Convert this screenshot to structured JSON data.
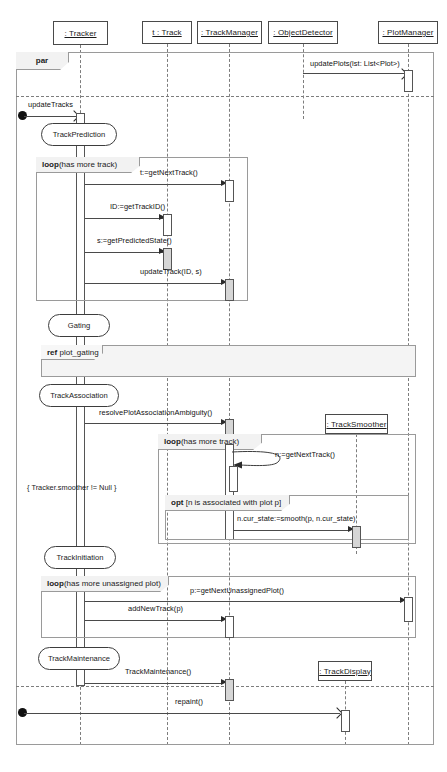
{
  "diagram": {
    "type": "uml-sequence-diagram",
    "title": ""
  },
  "lifelines": [
    {
      "id": "tracker",
      "label": ": Tracker"
    },
    {
      "id": "track",
      "label": "t : Track"
    },
    {
      "id": "trackmanager",
      "label": ": TrackManager"
    },
    {
      "id": "objectdetector",
      "label": ": ObjectDetector"
    },
    {
      "id": "plotmanager",
      "label": ": PlotManager"
    },
    {
      "id": "tracksmoother",
      "label": ": TrackSmoother"
    },
    {
      "id": "trackdisplay",
      "label": ": TrackDisplay"
    }
  ],
  "fragments": {
    "par": {
      "operator": "par",
      "guard": ""
    },
    "loop_track": {
      "operator": "loop",
      "guard": "(has more track)"
    },
    "loop_smoother": {
      "operator": "loop",
      "guard": "(has more track)"
    },
    "opt_assoc": {
      "operator": "opt",
      "guard": "[n is associated with plot p]"
    },
    "loop_unassigned": {
      "operator": "loop",
      "guard": "(has more unassigned plot)"
    },
    "ref_gating": {
      "operator": "ref",
      "guard": "plot_gating"
    }
  },
  "states": [
    {
      "id": "trackprediction",
      "label": "TrackPrediction"
    },
    {
      "id": "gating",
      "label": "Gating"
    },
    {
      "id": "trackassociation",
      "label": "TrackAssociation"
    },
    {
      "id": "trackinitiation",
      "label": "TrackInitiation"
    },
    {
      "id": "trackmaintenance",
      "label": "TrackMaintenance"
    }
  ],
  "messages": [
    {
      "id": "m1",
      "label": "updatePlots(lst: List<Plot>)"
    },
    {
      "id": "m2",
      "label": "updateTracks"
    },
    {
      "id": "m3",
      "label": "t:=getNextTrack()"
    },
    {
      "id": "m4",
      "label": "ID:=getTrackID()"
    },
    {
      "id": "m5",
      "label": "s:=getPredictedState()"
    },
    {
      "id": "m6",
      "label": "updateTrack(ID, s)"
    },
    {
      "id": "m7",
      "label": "resolvePlotAssociationAmbiguity()"
    },
    {
      "id": "m8",
      "label": "n:=getNextTrack()"
    },
    {
      "id": "m9",
      "label": "n.cur_state:=smooth(p, n.cur_state)"
    },
    {
      "id": "m10",
      "label": "p:=getNextUnassignedPlot()"
    },
    {
      "id": "m11",
      "label": "addNewTrack(p)"
    },
    {
      "id": "m12",
      "label": "TrackMaintenance()"
    },
    {
      "id": "m13",
      "label": "repaint()"
    }
  ],
  "constraints": [
    {
      "id": "c1",
      "label": "{ Tracker.smoother != Null }"
    }
  ],
  "colors": {
    "line": "#4a4a4a",
    "dash": "#7d7d7d",
    "fragment_border": "#9a9a9a",
    "tab_fill": "#f2f2f2",
    "ref_fill": "#f4f4f4",
    "activation_fill": "#d6d6d6",
    "background": "#ffffff"
  }
}
